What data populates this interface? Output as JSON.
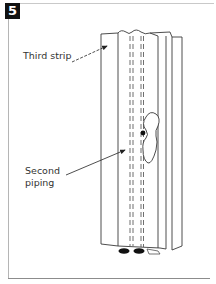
{
  "step": {
    "number": "5"
  },
  "labels": {
    "third_strip": "Third strip",
    "second_piping": "Second\npiping"
  },
  "illustration": {
    "subject": "folded fabric strip with piping",
    "icons": [
      "arrow-icon",
      "strip-illustration",
      "keyhole-shape",
      "piping-bead"
    ]
  },
  "colors": {
    "badge_bg": "#111111",
    "badge_text": "#ffffff",
    "line": "#3a3a3a",
    "text": "#333333",
    "frame": "#b5b5b5"
  }
}
